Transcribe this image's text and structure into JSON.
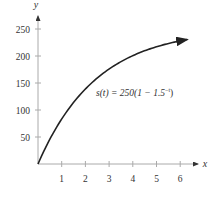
{
  "chart_data": {
    "type": "line",
    "title": "",
    "xlabel": "x",
    "ylabel": "y",
    "annotation": "s(t) = 250(1 − 1.5⁻ᵗ)",
    "x_ticks": [
      "1",
      "2",
      "3",
      "4",
      "5",
      "6"
    ],
    "y_ticks": [
      "50",
      "100",
      "150",
      "200",
      "250"
    ],
    "xlim": [
      0,
      6.5
    ],
    "ylim": [
      0,
      270
    ],
    "grid": false,
    "legend": null,
    "series": [
      {
        "name": "s(t) = 250(1 − 1.5^(−t))",
        "x": [
          0,
          0.5,
          1,
          1.5,
          2,
          2.5,
          3,
          3.5,
          4,
          4.5,
          5,
          5.5,
          6,
          6.3
        ],
        "y": [
          0,
          45.9,
          83.3,
          113.9,
          138.9,
          159.3,
          175.9,
          189.5,
          200.6,
          209.7,
          217.1,
          223.2,
          228.0,
          231.2
        ]
      }
    ]
  },
  "labels": {
    "x_axis": "x",
    "y_axis": "y",
    "equation": "s(t) = 250(1 − 1.5",
    "equation_exp": "−t",
    "equation_close": ")"
  }
}
